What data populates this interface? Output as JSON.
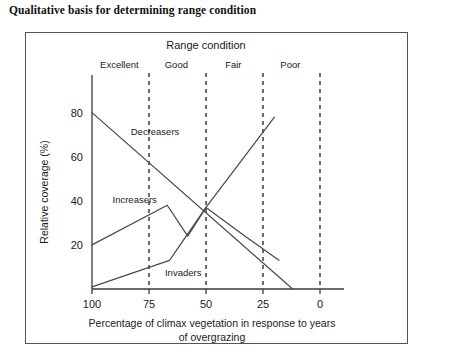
{
  "figure": {
    "title": "Qualitative basis for determining range condition"
  },
  "chart_data": {
    "type": "line",
    "title": "",
    "header_label": "Range condition",
    "xlabel": "Percentage of climax vegetation in response to years of overgrazing",
    "xlabel_line1": "Percentage of climax vegetation in response to years",
    "xlabel_line2": "of overgrazing",
    "ylabel": "Relative coverage (%)",
    "xlim": [
      100,
      0
    ],
    "ylim": [
      0,
      88
    ],
    "xticks": [
      100,
      75,
      50,
      25,
      0
    ],
    "yticks": [
      20,
      40,
      60,
      80
    ],
    "grid": false,
    "legend_position": "inline-annotations",
    "axis_direction_note": "x axis decreases left to right",
    "condition_classes": [
      {
        "label": "Excellent",
        "x_range": [
          100,
          75
        ],
        "label_x": 88
      },
      {
        "label": "Good",
        "x_range": [
          75,
          50
        ],
        "label_x": 63
      },
      {
        "label": "Fair",
        "x_range": [
          50,
          25
        ],
        "label_x": 38
      },
      {
        "label": "Poor",
        "x_range": [
          25,
          0
        ],
        "label_x": 13
      }
    ],
    "class_dividers_x": [
      75,
      50,
      25,
      0
    ],
    "series": [
      {
        "name": "Decreasers",
        "label_x": 83,
        "label_y": 70,
        "points": [
          [
            100,
            80
          ],
          [
            12,
            0
          ]
        ]
      },
      {
        "name": "Increasers",
        "label_x": 91,
        "label_y": 39,
        "points": [
          [
            100,
            20
          ],
          [
            67,
            38
          ],
          [
            58,
            24
          ],
          [
            50,
            37
          ],
          [
            33,
            24
          ],
          [
            18,
            13
          ]
        ]
      },
      {
        "name": "Invaders",
        "label_x": 68,
        "label_y": 6,
        "points": [
          [
            100,
            1
          ],
          [
            66,
            13
          ],
          [
            50,
            37
          ],
          [
            20,
            78
          ]
        ]
      }
    ]
  }
}
